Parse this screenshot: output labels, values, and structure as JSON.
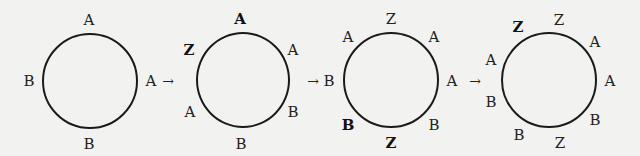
{
  "diagram": {
    "arrow_glyph": "→",
    "circles": [
      {
        "id": 1,
        "labels": [
          {
            "text": "A",
            "pos": "top",
            "bold": false
          },
          {
            "text": "A",
            "pos": "right",
            "bold": false
          },
          {
            "text": "B",
            "pos": "bottom",
            "bold": false
          },
          {
            "text": "B",
            "pos": "left",
            "bold": false
          }
        ]
      },
      {
        "id": 2,
        "labels": [
          {
            "text": "A",
            "pos": "top",
            "bold": true
          },
          {
            "text": "A",
            "pos": "upper-right",
            "bold": false
          },
          {
            "text": "B",
            "pos": "lower-right",
            "bold": false
          },
          {
            "text": "B",
            "pos": "bottom",
            "bold": false
          },
          {
            "text": "A",
            "pos": "lower-left",
            "bold": false
          },
          {
            "text": "Z",
            "pos": "upper-left",
            "bold": true
          }
        ]
      },
      {
        "id": 3,
        "labels": [
          {
            "text": "Z",
            "pos": "top",
            "bold": false
          },
          {
            "text": "A",
            "pos": "upper-right",
            "bold": false
          },
          {
            "text": "A",
            "pos": "right",
            "bold": false
          },
          {
            "text": "B",
            "pos": "lower-right",
            "bold": false
          },
          {
            "text": "Z",
            "pos": "bottom",
            "bold": true
          },
          {
            "text": "B",
            "pos": "lower-left",
            "bold": true
          },
          {
            "text": "B",
            "pos": "left",
            "bold": false
          },
          {
            "text": "A",
            "pos": "upper-left",
            "bold": false
          }
        ]
      },
      {
        "id": 4,
        "labels": [
          {
            "text": "Z",
            "pos": "top",
            "bold": false
          },
          {
            "text": "A",
            "pos": "upper-right",
            "bold": false
          },
          {
            "text": "A",
            "pos": "right",
            "bold": false
          },
          {
            "text": "B",
            "pos": "lower-right",
            "bold": false
          },
          {
            "text": "Z",
            "pos": "bottom",
            "bold": false
          },
          {
            "text": "B",
            "pos": "lower-left",
            "bold": false
          },
          {
            "text": "B",
            "pos": "left-lower",
            "bold": false
          },
          {
            "text": "A",
            "pos": "left-upper",
            "bold": false
          },
          {
            "text": "Z",
            "pos": "upper-left",
            "bold": true
          }
        ]
      }
    ]
  }
}
